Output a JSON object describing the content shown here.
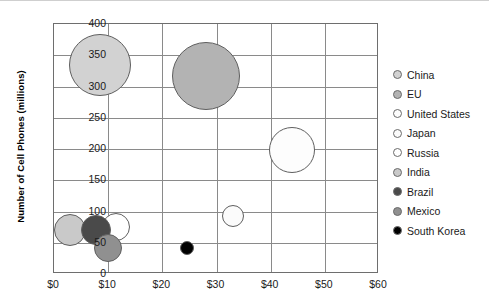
{
  "chart_data": {
    "type": "scatter",
    "title": "",
    "xlabel": "",
    "ylabel": "Number of Cell Phones (millions)",
    "xlim": [
      0,
      60
    ],
    "ylim": [
      0,
      400
    ],
    "grid": true,
    "legend_position": "right",
    "x_ticks": [
      "$0",
      "$10",
      "$20",
      "$30",
      "$40",
      "$50",
      "$60"
    ],
    "x_tick_values": [
      0,
      10,
      20,
      30,
      40,
      50,
      60
    ],
    "y_ticks": [
      "0",
      "50",
      "100",
      "150",
      "200",
      "250",
      "300",
      "350",
      "400"
    ],
    "y_tick_values": [
      0,
      50,
      100,
      150,
      200,
      250,
      300,
      350,
      400
    ],
    "bubble_note": "Bubble area encodes a third variable (population / market size)",
    "points": [
      {
        "name": "China",
        "x": 8.5,
        "y": 335,
        "r": 31,
        "color": "#d2d2d2"
      },
      {
        "name": "EU",
        "x": 28.0,
        "y": 317,
        "r": 34,
        "color": "#b3b3b3"
      },
      {
        "name": "United States",
        "x": 44.0,
        "y": 198,
        "r": 23,
        "color": "#fdfdfd"
      },
      {
        "name": "Japan",
        "x": 33.0,
        "y": 93,
        "r": 11,
        "color": "#fbfbfb"
      },
      {
        "name": "Russia",
        "x": 11.5,
        "y": 75,
        "r": 14,
        "color": "#ffffff"
      },
      {
        "name": "India",
        "x": 3.0,
        "y": 70,
        "r": 16,
        "color": "#c9c9c9"
      },
      {
        "name": "Brazil",
        "x": 7.8,
        "y": 70,
        "r": 15,
        "color": "#4a4a4a"
      },
      {
        "name": "Mexico",
        "x": 10.0,
        "y": 42,
        "r": 14,
        "color": "#909090"
      },
      {
        "name": "South Korea",
        "x": 24.5,
        "y": 42,
        "r": 7,
        "color": "#000000"
      }
    ]
  },
  "legend": {
    "items": [
      {
        "label": "China",
        "color": "#d2d2d2"
      },
      {
        "label": "EU",
        "color": "#b3b3b3"
      },
      {
        "label": "United States",
        "color": "#fdfdfd"
      },
      {
        "label": "Japan",
        "color": "#fbfbfb"
      },
      {
        "label": "Russia",
        "color": "#ffffff"
      },
      {
        "label": "India",
        "color": "#c9c9c9"
      },
      {
        "label": "Brazil",
        "color": "#4a4a4a"
      },
      {
        "label": "Mexico",
        "color": "#909090"
      },
      {
        "label": "South Korea",
        "color": "#000000"
      }
    ]
  }
}
